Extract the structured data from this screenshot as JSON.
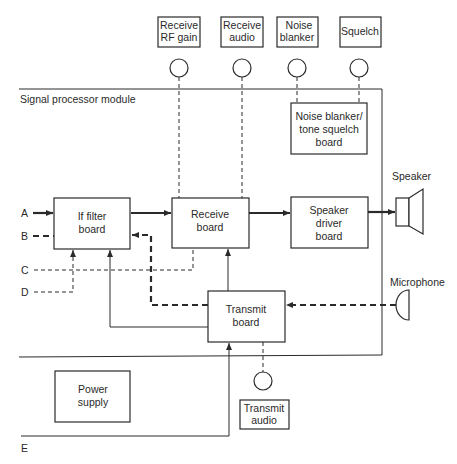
{
  "diagram": {
    "module_label": "Signal processor module",
    "controls": [
      {
        "id": "rf_gain",
        "line1": "Receive",
        "line2": "RF gain"
      },
      {
        "id": "receive_audio",
        "line1": "Receive",
        "line2": "audio"
      },
      {
        "id": "noise_blanker",
        "line1": "Noise",
        "line2": "blanker"
      },
      {
        "id": "squelch",
        "line1": "Squelch",
        "line2": ""
      },
      {
        "id": "transmit_audio",
        "line1": "Transmit",
        "line2": "audio"
      }
    ],
    "boards": {
      "noise_squelch": {
        "line1": "Noise blanker/",
        "line2": "tone squelch",
        "line3": "board"
      },
      "if_filter": {
        "line1": "If filter",
        "line2": "board"
      },
      "receive": {
        "line1": "Receive",
        "line2": "board"
      },
      "speaker_driver": {
        "line1": "Speaker",
        "line2": "driver",
        "line3": "board"
      },
      "transmit": {
        "line1": "Transmit",
        "line2": "board"
      },
      "power_supply": {
        "line1": "Power",
        "line2": "supply"
      }
    },
    "peripherals": {
      "speaker": "Speaker",
      "microphone": "Microphone"
    },
    "ports": {
      "a": "A",
      "b": "B",
      "c": "C",
      "d": "D",
      "e": "E"
    },
    "colors": {
      "ink": "#2a2a2a",
      "background": "#ffffff"
    }
  }
}
